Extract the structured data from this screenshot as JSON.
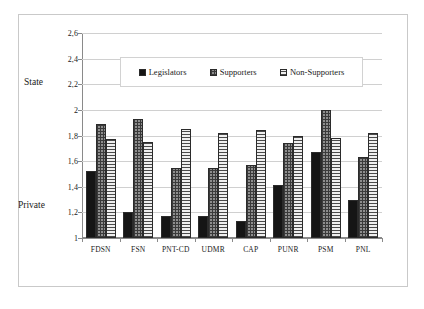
{
  "chart_data": {
    "type": "bar",
    "title": "",
    "subtitle": "",
    "xlabel": "",
    "ylabel": "",
    "ylim": [
      1,
      2.6
    ],
    "ytick_values": [
      1,
      1.2,
      1.4,
      1.6,
      1.8,
      2,
      2.2,
      2.4,
      2.6
    ],
    "ytick_labels": [
      "1",
      "1,2",
      "1,4",
      "1,6",
      "1,8",
      "2",
      "2,2",
      "2,4",
      "2,6"
    ],
    "decimal_separator": ",",
    "grid": true,
    "grid_axis": "y",
    "legend_position": "upper-center-inside",
    "scale_anchor_high": "State",
    "scale_anchor_low": "Private",
    "scale_anchor_high_value": "2,4",
    "scale_anchor_low_value": "1,2",
    "categories": [
      "FDSN",
      "FSN",
      "PNT-CD",
      "UDMR",
      "CAP",
      "PUNR",
      "PSM",
      "PNL"
    ],
    "series": [
      {
        "name": "Legislators",
        "pattern": "solid-black",
        "color": "#151515",
        "values": [
          1.52,
          1.2,
          1.17,
          1.17,
          1.13,
          1.41,
          1.67,
          1.3
        ]
      },
      {
        "name": "Supporters",
        "pattern": "dark-checkered",
        "color": "#8e8e8e",
        "values": [
          1.89,
          1.93,
          1.55,
          1.55,
          1.57,
          1.74,
          2.0,
          1.63
        ]
      },
      {
        "name": "Non-Supporters",
        "pattern": "light-horizontal-stripes",
        "color": "#efefef",
        "values": [
          1.77,
          1.75,
          1.85,
          1.82,
          1.84,
          1.8,
          1.78,
          1.82
        ]
      }
    ]
  }
}
